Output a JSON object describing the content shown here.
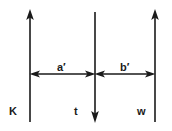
{
  "figure": {
    "type": "ray-diagram",
    "background_color": "#ffffff",
    "stroke_color": "#1a1a1a",
    "title": "",
    "vertical_rays": [
      {
        "name": "K",
        "label": "K",
        "x": 30,
        "y_top": 10,
        "y_bottom": 122,
        "arrow_direction": "up",
        "arrowhead_at": "top"
      },
      {
        "name": "t",
        "label": "t",
        "x": 95,
        "y_top": 12,
        "y_bottom": 122,
        "arrow_direction": "down",
        "arrowhead_at": "bottom"
      },
      {
        "name": "w",
        "label": "w",
        "x": 155,
        "y_top": 10,
        "y_bottom": 122,
        "arrow_direction": "up",
        "arrowhead_at": "top"
      }
    ],
    "dimension_arrows": [
      {
        "name": "a-prime",
        "label": "a′",
        "x_start": 30,
        "x_end": 95,
        "y": 74,
        "arrowheads": "both",
        "between": [
          "K",
          "t"
        ]
      },
      {
        "name": "b-prime",
        "label": "b′",
        "x_start": 95,
        "x_end": 155,
        "y": 74,
        "arrowheads": "both",
        "between": [
          "t",
          "w"
        ]
      }
    ]
  }
}
